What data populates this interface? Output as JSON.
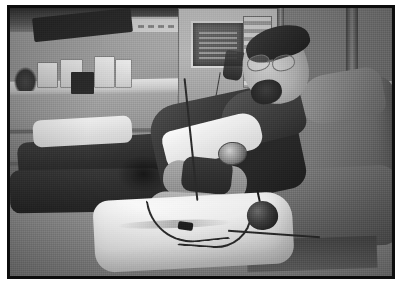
{
  "image": {
    "kind": "photograph",
    "capture_medium": "scanned print",
    "color_mode": "grayscale",
    "orientation": "landscape",
    "width_px": 402,
    "height_px": 287,
    "scene": "blood donation / apheresis room",
    "subject": "seated man donating blood",
    "alt_text": "Grayscale photo of a bearded man wearing glasses reclining in a blood donation chair with his arm extended on a white pillow, tubing and a squeeze bulb beside him, medical equipment and a supply counter in the background."
  },
  "frame": {
    "outer_background": "#ffffff",
    "border_color": "#0d0d0d",
    "border_width_px": 3,
    "margin_top_px": 5,
    "margin_side_px": 7,
    "margin_bottom_px": 8
  },
  "palette": {
    "highlight": "#ffffff",
    "light_gray": "#d6d6d6",
    "mid_gray": "#8c8c8c",
    "dark_gray": "#4a4a4a",
    "shadow": "#1d1d1d",
    "skin_tone": "#b9aa9d"
  },
  "regions": {
    "background": [
      {
        "name": "wall-upper",
        "description": "light painted wall across the upper band"
      },
      {
        "name": "wall-sign",
        "description": "framed notice mounted on the wall"
      },
      {
        "name": "ceiling-shadow",
        "description": "dark overhead shadow at top left"
      },
      {
        "name": "counter",
        "description": "supply counter with cabinetry below"
      },
      {
        "name": "supplies",
        "description": "boxes, bottles and a dark instrument case on the counter"
      },
      {
        "name": "machine",
        "description": "apheresis machine with lit display panel"
      },
      {
        "name": "iv-bag",
        "description": "collection bag hanging beside the machine"
      },
      {
        "name": "outlet",
        "description": "wall electrical outlet plate"
      },
      {
        "name": "bench-right",
        "description": "low bench and supplies at right"
      }
    ],
    "subject": [
      {
        "name": "head",
        "description": "man's head turned toward camera"
      },
      {
        "name": "glasses",
        "description": "wire-frame eyeglasses"
      },
      {
        "name": "goatee",
        "description": "short beard and moustache"
      },
      {
        "name": "torso",
        "description": "dark long-sleeve shirt"
      },
      {
        "name": "arm",
        "description": "extended donation arm with cuff"
      },
      {
        "name": "watch",
        "description": "wristwatch on the forearm"
      },
      {
        "name": "hand",
        "description": "relaxed hand resting on the pillow"
      },
      {
        "name": "legs",
        "description": "dark trousers stretched out on the chair"
      }
    ],
    "equipment": [
      {
        "name": "chair",
        "description": "reclining donation chair with headrest"
      },
      {
        "name": "pillow",
        "description": "white pillow supporting the arm"
      },
      {
        "name": "sheet",
        "description": "white drape across the lap"
      },
      {
        "name": "tubing",
        "description": "blood collection tubing looping over the linen"
      },
      {
        "name": "squeeze-bulb",
        "description": "hand squeeze bulb on the sheet"
      },
      {
        "name": "needle-site",
        "description": "taped venipuncture site"
      }
    ]
  }
}
